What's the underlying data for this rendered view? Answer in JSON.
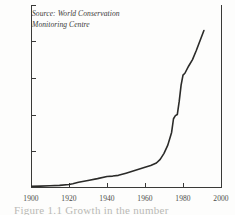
{
  "annotation": {
    "source_line1": "Source: World Conservation",
    "source_line2": "Monitoring Centre"
  },
  "caption": {
    "cropped_text": "Figure 1.1 Growth in the number"
  },
  "style": {
    "background": "#fdfdfc",
    "axis_color": "#3a3a38",
    "label_color": "#4a4a47",
    "line_color": "#2b2b29"
  },
  "chart_data": {
    "type": "line",
    "title": "",
    "subtitle": "",
    "xlabel": "",
    "ylabel": "",
    "xlim": [
      1900,
      2000
    ],
    "ylim": [
      0,
      1000
    ],
    "grid": false,
    "legend": null,
    "xticks": [
      "1900",
      "1920",
      "1940",
      "1960",
      "1980",
      "2000"
    ],
    "xtick_values": [
      1900,
      1920,
      1940,
      1960,
      1980,
      2000
    ],
    "yticks": [
      "200",
      "400",
      "600",
      "800",
      "1,000"
    ],
    "ytick_values": [
      200,
      400,
      600,
      800,
      1000
    ],
    "annotations": [
      "Source: World Conservation Monitoring Centre"
    ],
    "series": [
      {
        "name": "Cumulative total",
        "x": [
          1900,
          1905,
          1910,
          1915,
          1920,
          1922,
          1925,
          1930,
          1935,
          1940,
          1943,
          1946,
          1950,
          1955,
          1960,
          1963,
          1966,
          1968,
          1970,
          1972,
          1974,
          1975,
          1976,
          1977,
          1978,
          1979,
          1980,
          1981,
          1983,
          1985,
          1987,
          1989,
          1991
        ],
        "values": [
          4,
          5,
          7,
          9,
          14,
          18,
          26,
          36,
          46,
          58,
          60,
          64,
          76,
          92,
          108,
          118,
          132,
          152,
          185,
          230,
          300,
          375,
          392,
          398,
          470,
          560,
          615,
          625,
          665,
          700,
          750,
          805,
          860
        ]
      }
    ]
  }
}
